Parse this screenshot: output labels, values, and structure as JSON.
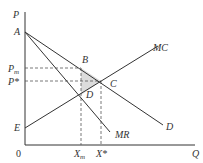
{
  "diagram": {
    "type": "monopoly-vs-competition",
    "axes": {
      "y_label": "P",
      "x_label": "Q",
      "origin_label": "0"
    },
    "price_labels": {
      "pm": "P",
      "pm_sub": "m",
      "pstar": "P*"
    },
    "quantity_labels": {
      "xm": "X",
      "xm_sub": "m",
      "xstar": "X*"
    },
    "points": {
      "A": "A",
      "B": "B",
      "C": "C",
      "D": "D",
      "E": "E"
    },
    "curves": {
      "mc": "MC",
      "demand": "D",
      "mr": "MR"
    },
    "colors": {
      "line": "#333333",
      "dash": "#555555",
      "shade": "#d9d9d9"
    }
  }
}
